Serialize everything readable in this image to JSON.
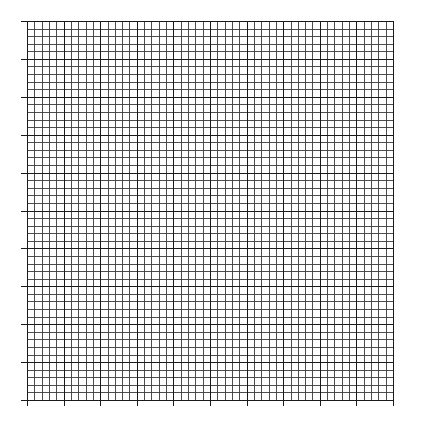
{
  "figure": {
    "type": "graph-paper",
    "major_divisions_x": 10,
    "major_divisions_y": 10,
    "minor_per_major": 5,
    "line_color": "#1a1a1a",
    "minor_line_color": "#3a3a3a",
    "background": "#ffffff",
    "ticks_left": true,
    "ticks_bottom": true
  }
}
